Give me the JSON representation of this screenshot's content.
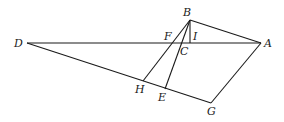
{
  "diagram": {
    "type": "geometry-figure",
    "points": [
      {
        "name": "D",
        "x": 27,
        "y": 43,
        "lx": 14,
        "ly": 47
      },
      {
        "name": "A",
        "x": 261,
        "y": 43,
        "lx": 264,
        "ly": 47
      },
      {
        "name": "B",
        "x": 190,
        "y": 20,
        "lx": 183,
        "ly": 16
      },
      {
        "name": "F",
        "x": 172,
        "y": 43,
        "lx": 164,
        "ly": 40
      },
      {
        "name": "I",
        "x": 190,
        "y": 43,
        "lx": 193,
        "ly": 40
      },
      {
        "name": "C",
        "x": 183,
        "y": 43,
        "lx": 180,
        "ly": 55
      },
      {
        "name": "H",
        "x": 143,
        "y": 81,
        "lx": 135,
        "ly": 93
      },
      {
        "name": "E",
        "x": 165,
        "y": 89,
        "lx": 158,
        "ly": 101
      },
      {
        "name": "G",
        "x": 211,
        "y": 103,
        "lx": 207,
        "ly": 115
      }
    ],
    "segments": [
      [
        "D",
        "A"
      ],
      [
        "D",
        "G"
      ],
      [
        "B",
        "A"
      ],
      [
        "A",
        "G"
      ],
      [
        "B",
        "H"
      ],
      [
        "B",
        "E"
      ],
      [
        "B",
        "I"
      ]
    ],
    "labels": {
      "A": "A",
      "B": "B",
      "C": "C",
      "D": "D",
      "E": "E",
      "F": "F",
      "G": "G",
      "H": "H",
      "I": "I"
    }
  }
}
